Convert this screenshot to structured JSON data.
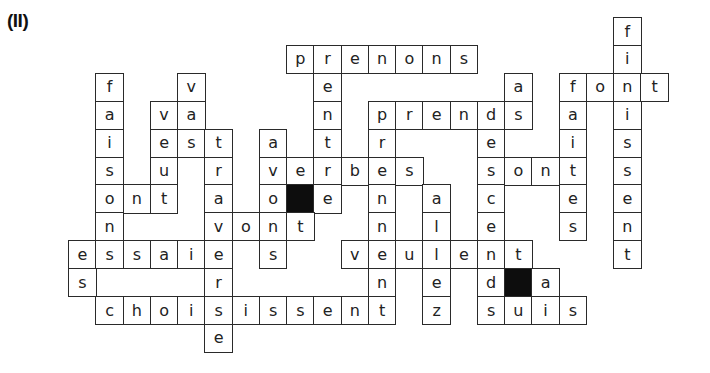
{
  "puzzle": {
    "label": "(II)",
    "grid_origin": {
      "x": 68,
      "y": 17
    },
    "cell_size": {
      "w": 27.25,
      "h": 27.9
    },
    "colors": {
      "line": "#2a2a2a",
      "text": "#222222",
      "black_square": "#0d0d0d",
      "background": "#ffffff"
    },
    "words_across": [
      {
        "word": "prenons",
        "row": 1,
        "col": 8
      },
      {
        "word": "font",
        "row": 2,
        "col": 18
      },
      {
        "word": "va",
        "row": 3,
        "col": 3
      },
      {
        "word": "prendes",
        "row": 3,
        "col": 11,
        "display": "prends"
      },
      {
        "word": "est",
        "row": 4,
        "col": 3
      },
      {
        "word": "verbes",
        "row": 5,
        "col": 7
      },
      {
        "word": "sont",
        "row": 5,
        "col": 15
      },
      {
        "word": "ont",
        "row": 6,
        "col": 1
      },
      {
        "word": "vont",
        "row": 7,
        "col": 5
      },
      {
        "word": "essaie",
        "row": 8,
        "col": 0
      },
      {
        "word": "veulent",
        "row": 8,
        "col": 10
      },
      {
        "word": "choisissent",
        "row": 10,
        "col": 1
      },
      {
        "word": "suis",
        "row": 10,
        "col": 15
      }
    ],
    "cells": [
      {
        "r": 0,
        "c": 20,
        "ch": "f"
      },
      {
        "r": 1,
        "c": 8,
        "ch": "p"
      },
      {
        "r": 1,
        "c": 9,
        "ch": "r"
      },
      {
        "r": 1,
        "c": 10,
        "ch": "e"
      },
      {
        "r": 1,
        "c": 11,
        "ch": "n"
      },
      {
        "r": 1,
        "c": 12,
        "ch": "o"
      },
      {
        "r": 1,
        "c": 13,
        "ch": "n"
      },
      {
        "r": 1,
        "c": 14,
        "ch": "s"
      },
      {
        "r": 1,
        "c": 20,
        "ch": "i"
      },
      {
        "r": 2,
        "c": 1,
        "ch": "f"
      },
      {
        "r": 2,
        "c": 4,
        "ch": "v"
      },
      {
        "r": 2,
        "c": 9,
        "ch": "e"
      },
      {
        "r": 2,
        "c": 16,
        "ch": "a"
      },
      {
        "r": 2,
        "c": 18,
        "ch": "f"
      },
      {
        "r": 2,
        "c": 19,
        "ch": "o"
      },
      {
        "r": 2,
        "c": 20,
        "ch": "n"
      },
      {
        "r": 2,
        "c": 21,
        "ch": "t"
      },
      {
        "r": 3,
        "c": 1,
        "ch": "a"
      },
      {
        "r": 3,
        "c": 3,
        "ch": "v"
      },
      {
        "r": 3,
        "c": 4,
        "ch": "a"
      },
      {
        "r": 3,
        "c": 9,
        "ch": "n"
      },
      {
        "r": 3,
        "c": 11,
        "ch": "p"
      },
      {
        "r": 3,
        "c": 12,
        "ch": "r"
      },
      {
        "r": 3,
        "c": 13,
        "ch": "e"
      },
      {
        "r": 3,
        "c": 14,
        "ch": "n"
      },
      {
        "r": 3,
        "c": 15,
        "ch": "d"
      },
      {
        "r": 3,
        "c": 16,
        "ch": "s"
      },
      {
        "r": 3,
        "c": 18,
        "ch": "a"
      },
      {
        "r": 3,
        "c": 20,
        "ch": "i"
      },
      {
        "r": 4,
        "c": 1,
        "ch": "i"
      },
      {
        "r": 4,
        "c": 3,
        "ch": "e"
      },
      {
        "r": 4,
        "c": 4,
        "ch": "s"
      },
      {
        "r": 4,
        "c": 5,
        "ch": "t"
      },
      {
        "r": 4,
        "c": 7,
        "ch": "a"
      },
      {
        "r": 4,
        "c": 9,
        "ch": "t"
      },
      {
        "r": 4,
        "c": 11,
        "ch": "r"
      },
      {
        "r": 4,
        "c": 15,
        "ch": "e"
      },
      {
        "r": 4,
        "c": 18,
        "ch": "i"
      },
      {
        "r": 4,
        "c": 20,
        "ch": "s"
      },
      {
        "r": 5,
        "c": 1,
        "ch": "s"
      },
      {
        "r": 5,
        "c": 3,
        "ch": "u"
      },
      {
        "r": 5,
        "c": 5,
        "ch": "r"
      },
      {
        "r": 5,
        "c": 7,
        "ch": "v"
      },
      {
        "r": 5,
        "c": 8,
        "ch": "e"
      },
      {
        "r": 5,
        "c": 9,
        "ch": "r"
      },
      {
        "r": 5,
        "c": 10,
        "ch": "b"
      },
      {
        "r": 5,
        "c": 11,
        "ch": "e"
      },
      {
        "r": 5,
        "c": 12,
        "ch": "s"
      },
      {
        "r": 5,
        "c": 15,
        "ch": "s"
      },
      {
        "r": 5,
        "c": 16,
        "ch": "o"
      },
      {
        "r": 5,
        "c": 17,
        "ch": "n"
      },
      {
        "r": 5,
        "c": 18,
        "ch": "t"
      },
      {
        "r": 5,
        "c": 20,
        "ch": "s"
      },
      {
        "r": 6,
        "c": 1,
        "ch": "o"
      },
      {
        "r": 6,
        "c": 2,
        "ch": "n"
      },
      {
        "r": 6,
        "c": 3,
        "ch": "t"
      },
      {
        "r": 6,
        "c": 5,
        "ch": "a"
      },
      {
        "r": 6,
        "c": 7,
        "ch": "o"
      },
      {
        "r": 6,
        "c": 8,
        "ch": "",
        "black": true
      },
      {
        "r": 6,
        "c": 9,
        "ch": "e"
      },
      {
        "r": 6,
        "c": 11,
        "ch": "n"
      },
      {
        "r": 6,
        "c": 13,
        "ch": "a"
      },
      {
        "r": 6,
        "c": 15,
        "ch": "c"
      },
      {
        "r": 6,
        "c": 18,
        "ch": "e"
      },
      {
        "r": 6,
        "c": 20,
        "ch": "e"
      },
      {
        "r": 7,
        "c": 1,
        "ch": "n"
      },
      {
        "r": 7,
        "c": 5,
        "ch": "v"
      },
      {
        "r": 7,
        "c": 6,
        "ch": "o"
      },
      {
        "r": 7,
        "c": 7,
        "ch": "n"
      },
      {
        "r": 7,
        "c": 8,
        "ch": "t"
      },
      {
        "r": 7,
        "c": 11,
        "ch": "n"
      },
      {
        "r": 7,
        "c": 13,
        "ch": "l"
      },
      {
        "r": 7,
        "c": 15,
        "ch": "e"
      },
      {
        "r": 7,
        "c": 18,
        "ch": "s"
      },
      {
        "r": 7,
        "c": 20,
        "ch": "n"
      },
      {
        "r": 8,
        "c": 0,
        "ch": "e"
      },
      {
        "r": 8,
        "c": 1,
        "ch": "s"
      },
      {
        "r": 8,
        "c": 2,
        "ch": "s"
      },
      {
        "r": 8,
        "c": 3,
        "ch": "a"
      },
      {
        "r": 8,
        "c": 4,
        "ch": "i"
      },
      {
        "r": 8,
        "c": 5,
        "ch": "e"
      },
      {
        "r": 8,
        "c": 7,
        "ch": "s"
      },
      {
        "r": 8,
        "c": 10,
        "ch": "v"
      },
      {
        "r": 8,
        "c": 11,
        "ch": "e"
      },
      {
        "r": 8,
        "c": 12,
        "ch": "u"
      },
      {
        "r": 8,
        "c": 13,
        "ch": "l"
      },
      {
        "r": 8,
        "c": 14,
        "ch": "e"
      },
      {
        "r": 8,
        "c": 15,
        "ch": "n"
      },
      {
        "r": 8,
        "c": 16,
        "ch": "t"
      },
      {
        "r": 8,
        "c": 20,
        "ch": "t"
      },
      {
        "r": 9,
        "c": 0,
        "ch": "s"
      },
      {
        "r": 9,
        "c": 5,
        "ch": "r"
      },
      {
        "r": 9,
        "c": 11,
        "ch": "n"
      },
      {
        "r": 9,
        "c": 13,
        "ch": "e"
      },
      {
        "r": 9,
        "c": 15,
        "ch": "d"
      },
      {
        "r": 9,
        "c": 16,
        "ch": "",
        "black": true
      },
      {
        "r": 9,
        "c": 17,
        "ch": "a"
      },
      {
        "r": 10,
        "c": 1,
        "ch": "c"
      },
      {
        "r": 10,
        "c": 2,
        "ch": "h"
      },
      {
        "r": 10,
        "c": 3,
        "ch": "o"
      },
      {
        "r": 10,
        "c": 4,
        "ch": "i"
      },
      {
        "r": 10,
        "c": 5,
        "ch": "s"
      },
      {
        "r": 10,
        "c": 6,
        "ch": "i"
      },
      {
        "r": 10,
        "c": 7,
        "ch": "s"
      },
      {
        "r": 10,
        "c": 8,
        "ch": "s"
      },
      {
        "r": 10,
        "c": 9,
        "ch": "e"
      },
      {
        "r": 10,
        "c": 10,
        "ch": "n"
      },
      {
        "r": 10,
        "c": 11,
        "ch": "t"
      },
      {
        "r": 10,
        "c": 13,
        "ch": "z"
      },
      {
        "r": 10,
        "c": 15,
        "ch": "s"
      },
      {
        "r": 10,
        "c": 16,
        "ch": "u"
      },
      {
        "r": 10,
        "c": 17,
        "ch": "i"
      },
      {
        "r": 10,
        "c": 18,
        "ch": "s"
      },
      {
        "r": 11,
        "c": 5,
        "ch": "e"
      }
    ]
  }
}
